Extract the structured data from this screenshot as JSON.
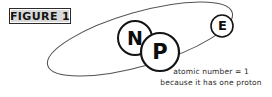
{
  "figure": {
    "label": "FIGURE 1",
    "label_box_fill": "#d9d9d9",
    "label_box_border": "#2b2b2b"
  },
  "diagram": {
    "type": "atom-model",
    "background": "#ffffff",
    "stroke_color": "#1a1a1a",
    "orbit": {
      "name": "electron-orbit-ellipse",
      "center_x": 140,
      "center_y": 39,
      "radius_x": 96,
      "radius_y": 27,
      "rotation_deg": -16
    },
    "particles": [
      {
        "id": "neutron",
        "label": "N",
        "cx": 135,
        "cy": 38,
        "r": 17
      },
      {
        "id": "proton",
        "label": "P",
        "cx": 160,
        "cy": 52,
        "r": 19
      },
      {
        "id": "electron",
        "label": "E",
        "cx": 222,
        "cy": 26,
        "r": 11
      }
    ]
  },
  "caption": {
    "line1": "atomic number = 1",
    "line2": "because it has one proton"
  }
}
